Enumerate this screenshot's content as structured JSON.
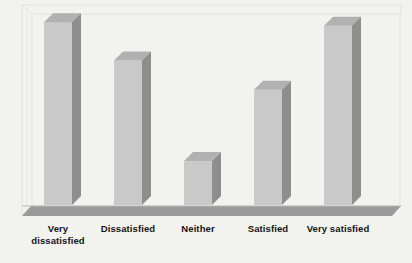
{
  "chart_data": {
    "type": "bar",
    "title": "",
    "subtitle": "",
    "xlabel": "",
    "ylabel": "",
    "categories": [
      "Very dissatisfied",
      "Dissatisfied",
      "Neither",
      "Satisfied",
      "Very satisfied"
    ],
    "category_lines": [
      [
        "Very",
        "dissatisfied"
      ],
      [
        "Dissatisfied"
      ],
      [
        "Neither"
      ],
      [
        "Satisfied"
      ],
      [
        "Very satisfied"
      ]
    ],
    "values": [
      100,
      79,
      24,
      63,
      98
    ],
    "ylim": [
      0,
      105
    ],
    "grid": false,
    "legend": null,
    "legend_position": "none",
    "style": "3d-column",
    "tick_labels": [],
    "annotations": []
  },
  "colors": {
    "background": "#f2f2ef",
    "bar_front": "#c9c9c9",
    "bar_top": "#b1b1b1",
    "bar_side": "#8e8e8e",
    "floor": "#9b9b9b",
    "floor_edge": "#8a8a8a",
    "frame_line": "#e0e0dd",
    "label_text": "#141414"
  },
  "geometry": {
    "baseline_y": 205,
    "plot_top_y": 13,
    "bar_width": 28,
    "depth_x": 9,
    "depth_y": 9,
    "bar_front_x": [
      44,
      114,
      184,
      254,
      324
    ],
    "floor_bottom_y": 216
  }
}
